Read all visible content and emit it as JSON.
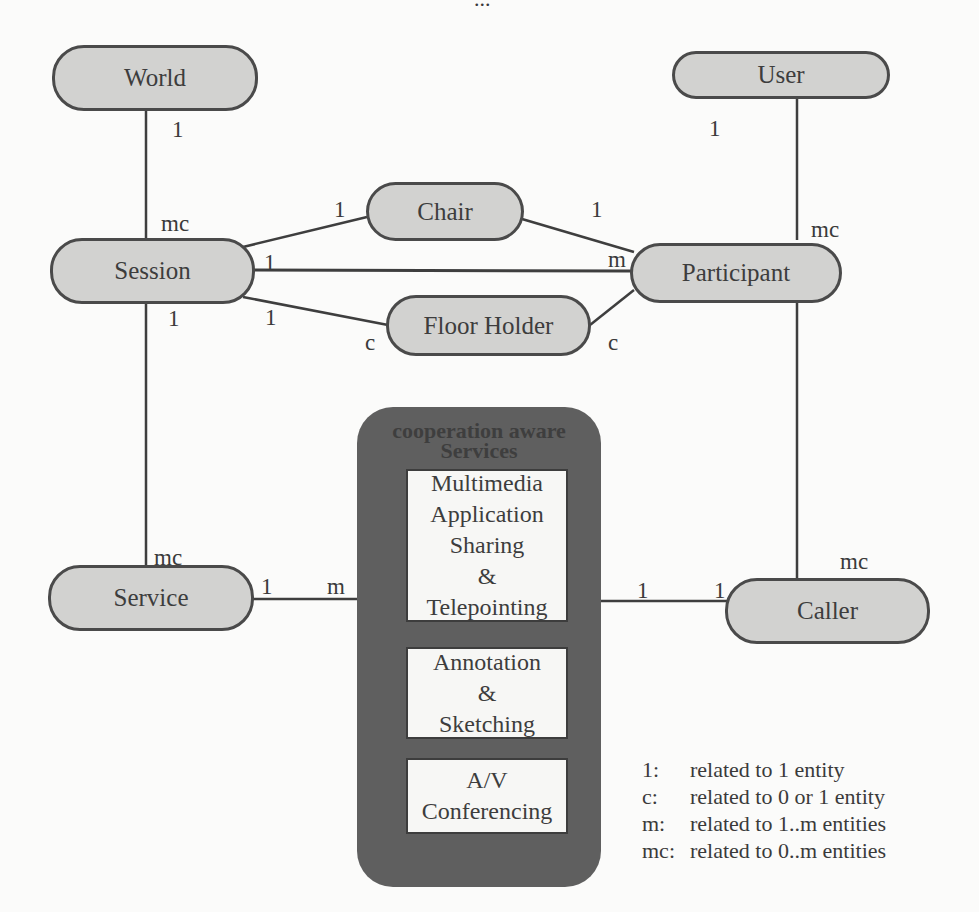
{
  "page": {
    "number_fragment": "..."
  },
  "entities": {
    "world": "World",
    "user": "User",
    "chair": "Chair",
    "session": "Session",
    "participant": "Participant",
    "floor_holder": "Floor Holder",
    "service": "Service",
    "caller": "Caller"
  },
  "services_group": {
    "title_line1": "cooperation aware",
    "title_line2": "Services",
    "boxes": [
      {
        "lines": [
          "Multimedia",
          "Application",
          "Sharing",
          "&",
          "Telepointing"
        ]
      },
      {
        "lines": [
          "Annotation",
          "&",
          "Sketching"
        ]
      },
      {
        "lines": [
          "A/V",
          "Conferencing"
        ]
      }
    ]
  },
  "relationships": [
    {
      "from": "World",
      "to": "Session",
      "from_card": "1",
      "to_card": "mc"
    },
    {
      "from": "User",
      "to": "Participant",
      "from_card": "1",
      "to_card": "mc"
    },
    {
      "from": "Session",
      "to": "Chair",
      "from_card": "1",
      "to_card": "1"
    },
    {
      "from": "Chair",
      "to": "Participant",
      "from_card": "1",
      "to_card": ""
    },
    {
      "from": "Session",
      "to": "Participant",
      "from_card": "1",
      "to_card": "m"
    },
    {
      "from": "Session",
      "to": "Floor Holder",
      "from_card": "1",
      "to_card": "c"
    },
    {
      "from": "Floor Holder",
      "to": "Participant",
      "from_card": "c",
      "to_card": ""
    },
    {
      "from": "Session",
      "to": "Service",
      "from_card": "1",
      "to_card": "mc"
    },
    {
      "from": "Participant",
      "to": "Caller",
      "from_card": "",
      "to_card": "mc"
    },
    {
      "from": "Service",
      "to": "cooperation aware Services",
      "from_card": "1",
      "to_card": "m"
    },
    {
      "from": "cooperation aware Services",
      "to": "Caller",
      "from_card": "1",
      "to_card": "1"
    }
  ],
  "cardinality_labels": {
    "world_session_top": "1",
    "world_session_bottom": "mc",
    "user_participant_top": "1",
    "user_participant_bottom": "mc",
    "session_chair": "1",
    "chair_left": "1",
    "chair_right": "1",
    "participant_m": "m",
    "session_participant": "1",
    "session_floor": "1",
    "session_service_top": "1",
    "floor_left_c": "c",
    "floor_right_c": "c",
    "service_top_mc": "mc",
    "service_right_1": "1",
    "services_left_m": "m",
    "services_right_1": "1",
    "caller_left_1": "1",
    "caller_top_mc": "mc"
  },
  "legend": [
    {
      "key": "1:",
      "text": "related to 1 entity"
    },
    {
      "key": "c:",
      "text": "related to 0 or 1 entity"
    },
    {
      "key": "m:",
      "text": "related to 1..m entities"
    },
    {
      "key": "mc:",
      "text": "related to 0..m entities"
    }
  ]
}
